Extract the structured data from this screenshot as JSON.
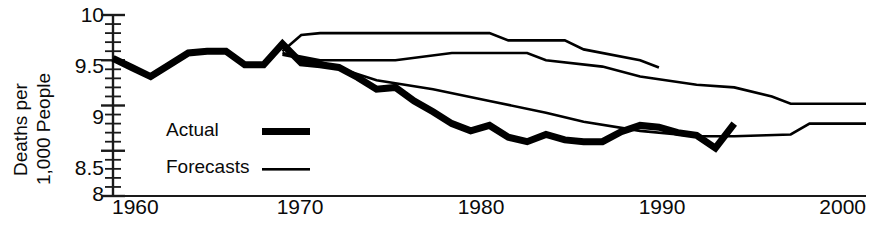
{
  "chart_data": {
    "type": "line",
    "title": "",
    "subtitle": "",
    "xlabel": "",
    "ylabel": "Deaths per 1,000 People",
    "ylabel_line1": "Deaths per",
    "ylabel_line2": "1,000 People",
    "xlim": [
      1960,
      2000
    ],
    "ylim": [
      8,
      10
    ],
    "grid": false,
    "legend_position": "inside-left",
    "x_ticks": [
      1960,
      1970,
      1980,
      1990,
      2000
    ],
    "x_tick_labels": [
      "1960",
      "1970",
      "1980",
      "1990",
      "2000"
    ],
    "y_ticks": [
      8,
      8.5,
      9,
      9.5,
      10
    ],
    "y_tick_labels": [
      "8",
      "8.5",
      "9",
      "9.5",
      "10"
    ],
    "y_minor_tick_step": 0.1,
    "series": [
      {
        "name": "Actual",
        "style": "thick",
        "color": "#000000",
        "x": [
          1960,
          1961,
          1962,
          1963,
          1964,
          1965,
          1966,
          1967,
          1968,
          1969,
          1970,
          1971,
          1972,
          1973,
          1974,
          1975,
          1976,
          1977,
          1978,
          1979,
          1980,
          1981,
          1982,
          1983,
          1984,
          1985,
          1986,
          1987,
          1988,
          1989,
          1990,
          1991,
          1992,
          1993
        ],
        "y": [
          9.52,
          9.42,
          9.32,
          9.45,
          9.58,
          9.6,
          9.6,
          9.45,
          9.45,
          9.68,
          9.47,
          9.45,
          9.42,
          9.31,
          9.18,
          9.2,
          9.05,
          8.93,
          8.8,
          8.72,
          8.78,
          8.65,
          8.6,
          8.68,
          8.62,
          8.6,
          8.6,
          8.71,
          8.78,
          8.76,
          8.7,
          8.67,
          8.53,
          8.8
        ]
      },
      {
        "name": "Forecasts",
        "style": "thin",
        "color": "#000000",
        "label": "Forecast upper",
        "x": [
          1969,
          1970,
          1971,
          1976,
          1980,
          1981,
          1984,
          1985,
          1988,
          1989
        ],
        "y": [
          9.6,
          9.78,
          9.8,
          9.8,
          9.8,
          9.72,
          9.72,
          9.62,
          9.5,
          9.42
        ]
      },
      {
        "name": "Forecasts",
        "style": "thin",
        "color": "#000000",
        "label": "Forecast middle",
        "x": [
          1969,
          1971,
          1975,
          1978,
          1982,
          1983,
          1986,
          1988,
          1991,
          1993,
          1995,
          1996,
          2000
        ],
        "y": [
          9.58,
          9.5,
          9.5,
          9.58,
          9.58,
          9.5,
          9.43,
          9.32,
          9.23,
          9.2,
          9.1,
          9.02,
          9.02
        ]
      },
      {
        "name": "Forecasts",
        "style": "thin",
        "color": "#000000",
        "label": "Forecast lower",
        "x": [
          1969,
          1971,
          1974,
          1977,
          1980,
          1983,
          1985,
          1988,
          1991,
          1993,
          1996,
          1997,
          2000
        ],
        "y": [
          9.56,
          9.48,
          9.28,
          9.18,
          9.05,
          8.92,
          8.82,
          8.72,
          8.66,
          8.66,
          8.68,
          8.8,
          8.8
        ]
      }
    ],
    "legend": [
      {
        "label": "Actual",
        "style": "thick"
      },
      {
        "label": "Forecasts",
        "style": "thin"
      }
    ]
  },
  "colors": {
    "line": "#000000",
    "axis": "#1a1a1a",
    "background": "#ffffff",
    "text": "#0a0a0a"
  }
}
